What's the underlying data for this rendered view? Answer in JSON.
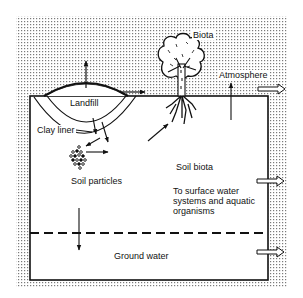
{
  "diagram": {
    "labels": {
      "biota": "Biota",
      "atmosphere": "Atmosphere",
      "landfill": "Landfill",
      "clay_liner": "Clay liner",
      "soil_particles": "Soil particles",
      "soil_biota": "Soil biota",
      "surface_water": "To surface water systems and aquatic organisms",
      "ground_water": "Ground water"
    },
    "colors": {
      "line": "#111111",
      "stipple": "#8a8a8a",
      "background": "#ffffff"
    },
    "regions": [
      "atmosphere (stippled)",
      "soil (white box)",
      "ground water (below dashed line)"
    ]
  }
}
